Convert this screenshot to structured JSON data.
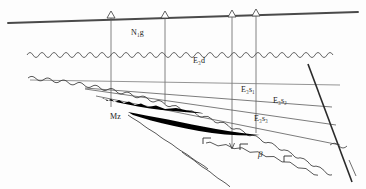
{
  "figure": {
    "type": "geological-cross-section",
    "width": 366,
    "height": 189,
    "background_color": "#fdfdfd",
    "line_color": "#3a3a3a",
    "fill_color": "#000000"
  },
  "labels": {
    "ng": "N₁g",
    "e3d": "E₃d",
    "e3s1": "E₃s₁",
    "e3s2": "E₃s₂",
    "e3s3": "E₃s₃",
    "mz": "Mz",
    "beta": "β"
  },
  "label_positions": [
    {
      "name": "ng",
      "text": "N₁g",
      "x": 131,
      "y": 29
    },
    {
      "name": "e3d",
      "text": "E₃d",
      "x": 193,
      "y": 57
    },
    {
      "name": "e3s1",
      "text": "E₃s₁",
      "x": 241,
      "y": 86
    },
    {
      "name": "e3s2",
      "text": "E₃s₂",
      "x": 273,
      "y": 97
    },
    {
      "name": "e3s3",
      "text": "E₃s₃",
      "x": 254,
      "y": 115
    },
    {
      "name": "mz",
      "text": "Mz",
      "x": 110,
      "y": 113
    },
    {
      "name": "beta",
      "text": "β",
      "x": 258,
      "y": 152
    }
  ],
  "wells": [
    {
      "name": "well-1",
      "surface_x": 111,
      "surface_y": 17,
      "bottom_y": 107
    },
    {
      "name": "well-2",
      "surface_x": 165,
      "surface_y": 19,
      "bottom_y": 104
    },
    {
      "name": "well-3",
      "surface_x": 232,
      "surface_y": 17,
      "bottom_y": 148
    },
    {
      "name": "well-4",
      "surface_x": 256,
      "surface_y": 16,
      "bottom_y": 133
    }
  ],
  "horizons": [
    {
      "name": "ground-surface",
      "style": "thick-straight"
    },
    {
      "name": "unconformity-upper",
      "style": "wavy"
    },
    {
      "name": "basement-unconformity",
      "style": "wavy"
    },
    {
      "name": "e3s1-base",
      "style": "straight"
    },
    {
      "name": "e3s2-base",
      "style": "straight"
    },
    {
      "name": "e3s3-base",
      "style": "straight"
    },
    {
      "name": "fault-right",
      "style": "straight-thick"
    }
  ],
  "bodies": [
    {
      "name": "sand-body-upper",
      "fill": "#000000"
    },
    {
      "name": "sand-body-lower",
      "fill": "#000000"
    }
  ],
  "symbols": [
    {
      "name": "volcanic-bracket-left",
      "glyph": "Γ",
      "x": 242,
      "y": 143
    },
    {
      "name": "volcanic-bracket-right",
      "glyph": "Γ",
      "x": 286,
      "y": 155
    },
    {
      "name": "volcanic-bracket-mid",
      "glyph": "Γ",
      "x": 205,
      "y": 137
    }
  ]
}
